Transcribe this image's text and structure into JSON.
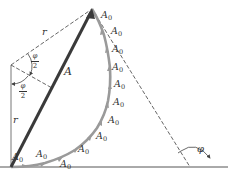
{
  "diagram": {
    "type": "phasor-diagram",
    "colors": {
      "resultant": "#3a3a3a",
      "arc_phasors": "#9a9a9a",
      "construction_lines": "#444444",
      "text": "#333333"
    },
    "labels": {
      "radius_top": "r",
      "radius_left": "r",
      "resultant": "A",
      "half_angle_top_num": "φ",
      "half_angle_top_den": "2",
      "half_angle_bottom_num": "φ",
      "half_angle_bottom_den": "2",
      "angle": "φ",
      "phasor_base": "A",
      "phasor_sub": "0"
    },
    "phasor_labels": [
      {
        "x": 12,
        "y": 152
      },
      {
        "x": 36,
        "y": 149
      },
      {
        "x": 60,
        "y": 159
      },
      {
        "x": 78,
        "y": 144
      },
      {
        "x": 96,
        "y": 131
      },
      {
        "x": 108,
        "y": 115
      },
      {
        "x": 113,
        "y": 97
      },
      {
        "x": 114,
        "y": 79
      },
      {
        "x": 112,
        "y": 62
      },
      {
        "x": 112,
        "y": 44
      },
      {
        "x": 111,
        "y": 26
      },
      {
        "x": 101,
        "y": 10
      }
    ]
  }
}
